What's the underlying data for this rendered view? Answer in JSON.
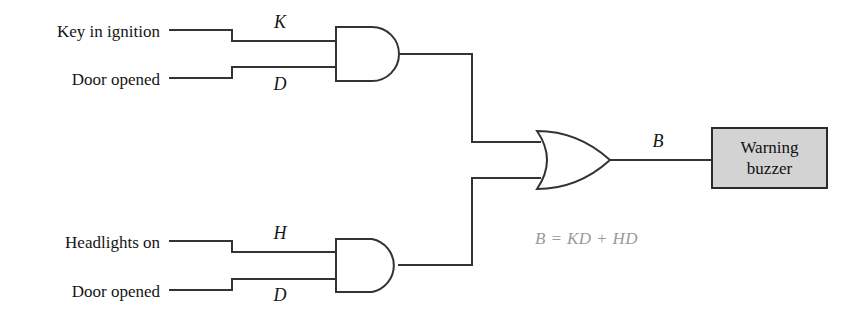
{
  "diagram": {
    "line_color": "#333333",
    "box_fill": "#d3d3d3",
    "box_border": "#2b2b2b",
    "equation_color": "#9a9a9a",
    "inputs": [
      {
        "id": "key",
        "label": "Key in ignition",
        "signal": "K"
      },
      {
        "id": "door_top",
        "label": "Door opened",
        "signal": "D"
      },
      {
        "id": "headlights",
        "label": "Headlights on",
        "signal": "H"
      },
      {
        "id": "door_bottom",
        "label": "Door opened",
        "signal": "D"
      }
    ],
    "gates": [
      {
        "id": "and-top",
        "type": "AND",
        "inputs": [
          "K",
          "D"
        ]
      },
      {
        "id": "and-bottom",
        "type": "AND",
        "inputs": [
          "H",
          "D"
        ]
      },
      {
        "id": "or-main",
        "type": "OR",
        "inputs": [
          "KD",
          "HD"
        ],
        "output": "B"
      }
    ],
    "output_signal": "B",
    "output_device": {
      "line1": "Warning",
      "line2": "buzzer"
    },
    "equation": "B = KD + HD"
  }
}
